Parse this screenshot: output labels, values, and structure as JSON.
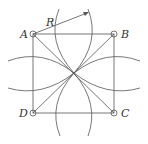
{
  "diagram": {
    "points": {
      "A": {
        "label": "A",
        "x": 33,
        "y": 34
      },
      "B": {
        "label": "B",
        "x": 114,
        "y": 34
      },
      "C": {
        "label": "C",
        "x": 114,
        "y": 113
      },
      "D": {
        "label": "D",
        "x": 33,
        "y": 113
      }
    },
    "radius_label": "R",
    "colors": {
      "stroke": "#555555",
      "text": "#333333",
      "background": "#ffffff"
    }
  }
}
